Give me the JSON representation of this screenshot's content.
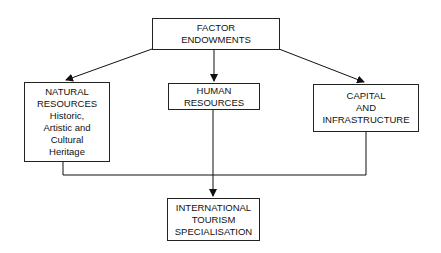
{
  "diagram": {
    "nodes": {
      "factor": {
        "lines": [
          "FACTOR",
          "ENDOWMENTS"
        ]
      },
      "natural": {
        "lines": [
          "NATURAL",
          "RESOURCES",
          "Historic,",
          "Artistic and",
          "Cultural",
          "Heritage"
        ]
      },
      "human": {
        "lines": [
          "HUMAN",
          "RESOURCES"
        ]
      },
      "capital": {
        "lines": [
          "CAPITAL",
          "AND",
          "INFRASTRUCTURE"
        ]
      },
      "tourism": {
        "lines": [
          "INTERNATIONAL",
          "TOURISM",
          "SPECIALISATION"
        ]
      }
    },
    "edges": [
      {
        "from": "factor",
        "to": "natural",
        "type": "arrow"
      },
      {
        "from": "factor",
        "to": "human",
        "type": "arrow"
      },
      {
        "from": "factor",
        "to": "capital",
        "type": "arrow"
      },
      {
        "from": "natural",
        "to": "tourism",
        "type": "line-join"
      },
      {
        "from": "human",
        "to": "tourism",
        "type": "arrow"
      },
      {
        "from": "capital",
        "to": "tourism",
        "type": "line-join"
      }
    ]
  }
}
